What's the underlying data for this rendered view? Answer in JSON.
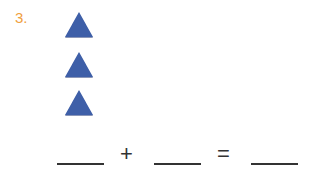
{
  "problem": {
    "number": "3.",
    "shape": "triangle",
    "shape_color": "#3e5fa8",
    "shape_count": 3,
    "equation": {
      "blank1": "",
      "operator": "+",
      "blank2": "",
      "equals": "=",
      "blank3": ""
    }
  }
}
